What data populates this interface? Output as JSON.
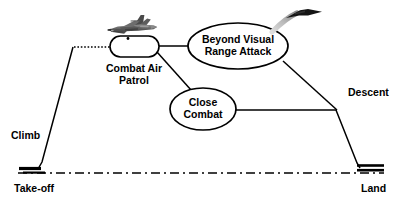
{
  "diagram": {
    "type": "mission-profile-flow"
  },
  "nodes": {
    "combat_air_patrol": {
      "label_line1": "Combat Air",
      "label_line2": "Patrol",
      "shape": "rounded-rectangle"
    },
    "beyond_visual_range": {
      "label_line1": "Beyond Visual",
      "label_line2": "Range Attack",
      "shape": "ellipse"
    },
    "close_combat": {
      "label_line1": "Close",
      "label_line2": "Combat",
      "shape": "ellipse"
    }
  },
  "phase_labels": {
    "climb": "Climb",
    "descent": "Descent",
    "takeoff": "Take-off",
    "land": "Land"
  },
  "icons": {
    "fighter_jet": "fighter-jet-icon",
    "missile_arrow": "missile-launch-arrow-icon"
  },
  "colors": {
    "stroke": "#000000",
    "fill": "#ffffff",
    "jet_body": "#6e6e6e",
    "jet_dark": "#3a3a3a",
    "arrow_dark": "#111111",
    "arrow_fade": "#c9c9c9",
    "background": "#ffffff"
  },
  "geometry": {
    "ground_line_y": 172,
    "takeoff_runway_x": 20,
    "land_runway_x": 358
  }
}
